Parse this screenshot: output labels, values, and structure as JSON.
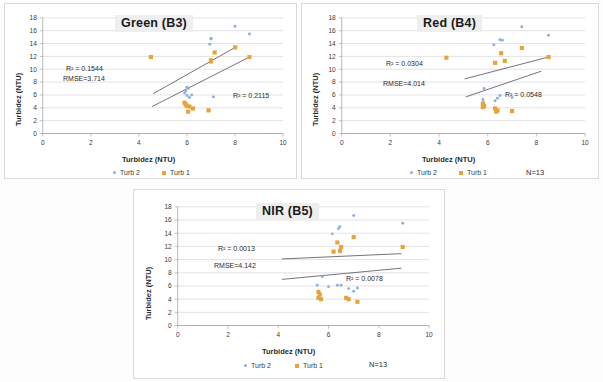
{
  "figure": {
    "background_color": "#fdfdfd",
    "panel_border_color": "#d9d9d9",
    "series_colors": {
      "turb2_blue": "#8fb0dc",
      "turb1_orange": "#e8a33d",
      "trendline": "#4f4f58",
      "gridline": "#d0d0d0"
    }
  },
  "axes_common": {
    "xlabel": "Turbidez (NTU)",
    "ylabel": "Turbidez (NTU)",
    "xticks": [
      "0",
      "2",
      "4",
      "6",
      "8",
      "10"
    ],
    "yticks": [
      "0",
      "2",
      "4",
      "6",
      "8",
      "10",
      "12",
      "14",
      "16",
      "18"
    ],
    "xlim": [
      0,
      10
    ],
    "ylim": [
      0,
      18
    ]
  },
  "legend": {
    "turb2_label": "Turb 2",
    "turb1_label": "Turb 1",
    "turb2_marker": "small-blue-dot-icon",
    "turb1_marker": "orange-square-icon"
  },
  "charts": [
    {
      "id": "green",
      "title": "Green (B3)",
      "n_label": "",
      "annotations": {
        "r2_upper_prefix": "R",
        "r2_upper": "² = 0.1544",
        "rmse": "RMSE=3.714",
        "r2_lower_prefix": "R",
        "r2_lower": "² = 0.2115"
      }
    },
    {
      "id": "red",
      "title": "Red (B4)",
      "n_label": "N=13",
      "annotations": {
        "r2_upper_prefix": "R",
        "r2_upper": "² = 0.0304",
        "rmse": "RMSE=4.014",
        "r2_lower_prefix": "R",
        "r2_lower": "² = 0.0548"
      }
    },
    {
      "id": "nir",
      "title": "NIR (B5)",
      "n_label": "N=13",
      "annotations": {
        "r2_upper_prefix": "R",
        "r2_upper": "² = 0.0013",
        "rmse": "RMSE=4.142",
        "r2_lower_prefix": "R",
        "r2_lower": "² = 0.0078"
      }
    }
  ],
  "chart_data": [
    {
      "type": "scatter",
      "title": "Green (B3)",
      "xlabel": "Turbidez (NTU)",
      "ylabel": "Turbidez (NTU)",
      "xlim": [
        0,
        10
      ],
      "ylim": [
        0,
        18
      ],
      "grid": "horizontal",
      "legend_position": "bottom",
      "annotations": [
        "R² = 0.1544",
        "RMSE=3.714",
        "R² = 0.2115"
      ],
      "series": [
        {
          "name": "Turb 2",
          "marker": "dot",
          "color": "#8fb0dc",
          "points": [
            [
              8.0,
              16.7
            ],
            [
              8.6,
              15.5
            ],
            [
              7.0,
              14.8
            ],
            [
              7.0,
              14.7
            ],
            [
              6.95,
              13.9
            ],
            [
              7.1,
              5.7
            ],
            [
              6.0,
              7.2
            ],
            [
              6.05,
              7.0
            ],
            [
              5.95,
              6.6
            ],
            [
              6.2,
              6.0
            ],
            [
              6.0,
              5.9
            ],
            [
              6.1,
              5.6
            ],
            [
              5.9,
              6.3
            ]
          ]
        },
        {
          "name": "Turb 1",
          "marker": "square",
          "color": "#e8a33d",
          "points": [
            [
              4.5,
              11.9
            ],
            [
              7.15,
              12.6
            ],
            [
              7.0,
              11.4
            ],
            [
              7.0,
              11.2
            ],
            [
              8.0,
              13.4
            ],
            [
              8.6,
              11.9
            ],
            [
              5.9,
              4.8
            ],
            [
              5.95,
              4.5
            ],
            [
              6.0,
              4.3
            ],
            [
              6.1,
              4.2
            ],
            [
              6.25,
              3.9
            ],
            [
              6.05,
              3.4
            ],
            [
              6.9,
              3.6
            ]
          ]
        }
      ],
      "trendlines": [
        {
          "name": "upper",
          "x0": 4.6,
          "y0": 6.2,
          "x1": 8.1,
          "y1": 13.6,
          "r2": 0.1544
        },
        {
          "name": "lower",
          "x0": 4.55,
          "y0": 4.2,
          "x1": 8.6,
          "y1": 11.9,
          "r2": 0.2115
        }
      ]
    },
    {
      "type": "scatter",
      "title": "Red (B4)",
      "xlabel": "Turbidez (NTU)",
      "ylabel": "Turbidez (NTU)",
      "xlim": [
        0,
        10
      ],
      "ylim": [
        0,
        18
      ],
      "grid": "horizontal",
      "legend_position": "bottom",
      "n": 13,
      "annotations": [
        "R² = 0.0304",
        "RMSE=4.014",
        "R² = 0.0548",
        "N=13"
      ],
      "series": [
        {
          "name": "Turb 2",
          "marker": "dot",
          "color": "#8fb0dc",
          "points": [
            [
              7.4,
              16.6
            ],
            [
              8.5,
              15.3
            ],
            [
              6.5,
              14.6
            ],
            [
              6.6,
              14.5
            ],
            [
              6.25,
              13.8
            ],
            [
              7.0,
              5.6
            ],
            [
              5.85,
              7.0
            ],
            [
              5.8,
              5.3
            ],
            [
              5.82,
              4.9
            ],
            [
              6.3,
              5.1
            ],
            [
              6.4,
              5.5
            ],
            [
              6.5,
              5.9
            ],
            [
              5.85,
              4.4
            ]
          ]
        },
        {
          "name": "Turb 1",
          "marker": "square",
          "color": "#e8a33d",
          "points": [
            [
              4.3,
              11.8
            ],
            [
              6.55,
              12.5
            ],
            [
              6.3,
              11.0
            ],
            [
              6.7,
              11.3
            ],
            [
              7.4,
              13.3
            ],
            [
              8.5,
              11.9
            ],
            [
              5.8,
              4.6
            ],
            [
              5.85,
              4.3
            ],
            [
              5.8,
              4.1
            ],
            [
              6.3,
              3.9
            ],
            [
              6.35,
              3.4
            ],
            [
              6.4,
              3.6
            ],
            [
              7.0,
              3.5
            ]
          ]
        }
      ],
      "trendlines": [
        {
          "name": "upper",
          "x0": 5.05,
          "y0": 8.5,
          "x1": 8.5,
          "y1": 11.9,
          "r2": 0.0304
        },
        {
          "name": "lower",
          "x0": 5.1,
          "y0": 5.7,
          "x1": 8.2,
          "y1": 9.7,
          "r2": 0.0548
        }
      ]
    },
    {
      "type": "scatter",
      "title": "NIR (B5)",
      "xlabel": "Turbidez (NTU)",
      "ylabel": "Turbidez (NTU)",
      "xlim": [
        0,
        10
      ],
      "ylim": [
        0,
        18
      ],
      "grid": "horizontal",
      "legend_position": "bottom",
      "n": 13,
      "annotations": [
        "R² = 0.0013",
        "RMSE=4.142",
        "R² = 0.0078",
        "N=13"
      ],
      "series": [
        {
          "name": "Turb 2",
          "marker": "dot",
          "color": "#8fb0dc",
          "points": [
            [
              7.0,
              16.7
            ],
            [
              8.95,
              15.5
            ],
            [
              6.45,
              15.0
            ],
            [
              6.4,
              14.7
            ],
            [
              6.15,
              13.9
            ],
            [
              7.15,
              5.7
            ],
            [
              5.75,
              7.4
            ],
            [
              5.55,
              6.1
            ],
            [
              6.35,
              6.1
            ],
            [
              6.5,
              6.1
            ],
            [
              7.0,
              5.2
            ],
            [
              6.8,
              5.6
            ],
            [
              6.0,
              5.9
            ]
          ]
        },
        {
          "name": "Turb 1",
          "marker": "square",
          "color": "#e8a33d",
          "points": [
            [
              6.5,
              11.9
            ],
            [
              6.35,
              12.6
            ],
            [
              6.2,
              11.2
            ],
            [
              6.45,
              11.3
            ],
            [
              7.0,
              13.4
            ],
            [
              8.95,
              11.9
            ],
            [
              5.6,
              5.1
            ],
            [
              5.65,
              4.7
            ],
            [
              5.6,
              4.2
            ],
            [
              5.7,
              4.0
            ],
            [
              6.7,
              4.2
            ],
            [
              6.8,
              4.0
            ],
            [
              7.15,
              3.6
            ]
          ]
        }
      ],
      "trendlines": [
        {
          "name": "upper",
          "x0": 4.15,
          "y0": 10.1,
          "x1": 8.9,
          "y1": 10.9,
          "r2": 0.0013
        },
        {
          "name": "lower",
          "x0": 4.15,
          "y0": 7.0,
          "x1": 8.9,
          "y1": 8.7,
          "r2": 0.0078
        }
      ]
    }
  ]
}
